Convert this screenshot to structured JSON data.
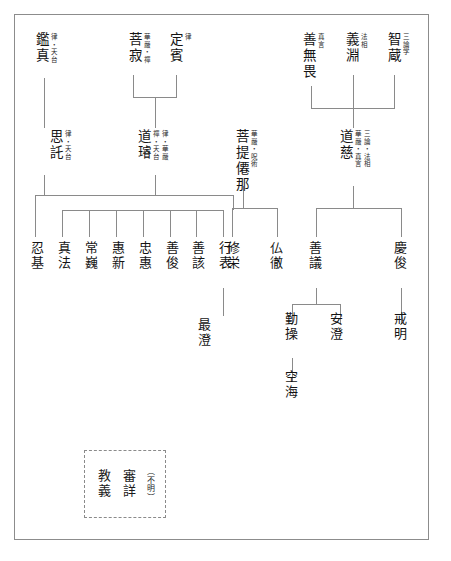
{
  "diagram": {
    "frame": {
      "style": "solid-rectangle",
      "color": "#8c8c8c"
    },
    "line_color": "#8a8a8a",
    "text_color": "#141414",
    "writing_mode": "vertical",
    "nodes": [
      {
        "id": "ganjin",
        "name": "鑑真",
        "annotations": [
          "律・天台"
        ],
        "x": 33,
        "y": 32
      },
      {
        "id": "bojaku",
        "name": "菩寂",
        "annotations": [
          "華嚴・禪"
        ],
        "x": 126,
        "y": 32
      },
      {
        "id": "johin",
        "name": "定賓",
        "annotations": [
          "律"
        ],
        "x": 167,
        "y": 32
      },
      {
        "id": "zenmui",
        "name": "善無畏",
        "annotations": [
          "真言"
        ],
        "x": 300,
        "y": 32
      },
      {
        "id": "gien",
        "name": "義淵",
        "annotations": [
          "法相"
        ],
        "x": 343,
        "y": 32
      },
      {
        "id": "chizo",
        "name": "智蔵",
        "annotations": [
          "三論学"
        ],
        "x": 385,
        "y": 32
      },
      {
        "id": "shitaku",
        "name": "思託",
        "annotations": [
          "律・天台"
        ],
        "x": 47,
        "y": 129
      },
      {
        "id": "dosen",
        "name": "道璿",
        "annotations": [
          "禪・天台",
          "律・華嚴"
        ],
        "x": 135,
        "y": 129
      },
      {
        "id": "bodaisenna",
        "name": "菩提僊那",
        "annotations": [
          "華嚴・呪術"
        ],
        "x": 233,
        "y": 129
      },
      {
        "id": "doji",
        "name": "道慈",
        "annotations": [
          "華嚴・真言",
          "三論・法相"
        ],
        "x": 337,
        "y": 129
      },
      {
        "id": "ninki",
        "name": "忍基",
        "annotations": [],
        "x": 29,
        "y": 241
      },
      {
        "id": "shinpo",
        "name": "真法",
        "annotations": [],
        "x": 56,
        "y": 241
      },
      {
        "id": "jogi",
        "name": "常巍",
        "annotations": [],
        "x": 83,
        "y": 241
      },
      {
        "id": "eshin",
        "name": "惠新",
        "annotations": [],
        "x": 110,
        "y": 241
      },
      {
        "id": "chue",
        "name": "忠惠",
        "annotations": [],
        "x": 137,
        "y": 241
      },
      {
        "id": "zenshun",
        "name": "善俊",
        "annotations": [],
        "x": 164,
        "y": 241
      },
      {
        "id": "zengai",
        "name": "善該",
        "annotations": [],
        "x": 190,
        "y": 241
      },
      {
        "id": "gyohyo",
        "name": "行表",
        "annotations": [],
        "x": 217,
        "y": 241
      },
      {
        "id": "shuei",
        "name": "修栄",
        "annotations": [],
        "x": 225,
        "y": 241
      },
      {
        "id": "buttetsu",
        "name": "仏徹",
        "annotations": [],
        "x": 268,
        "y": 241
      },
      {
        "id": "zengi",
        "name": "善議",
        "annotations": [],
        "x": 307,
        "y": 241
      },
      {
        "id": "keishun",
        "name": "慶俊",
        "annotations": [],
        "x": 392,
        "y": 241
      },
      {
        "id": "saicho",
        "name": "最澄",
        "annotations": [],
        "x": 196,
        "y": 318
      },
      {
        "id": "gonso",
        "name": "勤操",
        "annotations": [],
        "x": 283,
        "y": 312
      },
      {
        "id": "ancho",
        "name": "安澄",
        "annotations": [],
        "x": 328,
        "y": 312
      },
      {
        "id": "kaimyo",
        "name": "戒明",
        "annotations": [],
        "x": 392,
        "y": 312
      },
      {
        "id": "kukai",
        "name": "空海",
        "annotations": [],
        "x": 283,
        "y": 370
      }
    ],
    "unknown_box": {
      "label": "不明",
      "note": "（不明）",
      "names": [
        "審詳",
        "教義"
      ],
      "border": "dashed"
    }
  }
}
